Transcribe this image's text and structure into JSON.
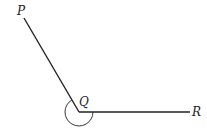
{
  "diagram": {
    "type": "angle",
    "points": {
      "P": {
        "label": "P",
        "x": 24,
        "y": 18
      },
      "Q": {
        "label": "Q",
        "x": 79,
        "y": 112
      },
      "R": {
        "label": "R",
        "x": 190,
        "y": 112
      }
    },
    "segments": [
      [
        "P",
        "Q"
      ],
      [
        "Q",
        "R"
      ]
    ],
    "angle_mark": {
      "vertex": "Q",
      "kind": "reflex",
      "radius": 14
    },
    "colors": {
      "stroke": "#222222",
      "background": "#ffffff"
    }
  }
}
